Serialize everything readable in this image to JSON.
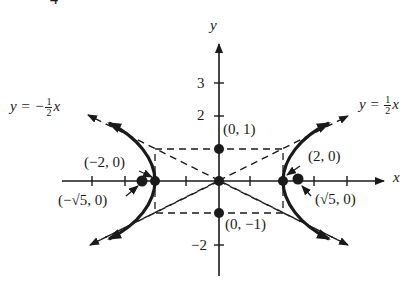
{
  "figure": {
    "number_label": "4",
    "axes": {
      "x_label": "x",
      "y_label": "y",
      "y_ticks": [
        "3",
        "2",
        "−2"
      ]
    },
    "asymptotes": {
      "left": {
        "prefix": "y = −",
        "num": "1",
        "den": "2",
        "var": "x"
      },
      "right": {
        "prefix": "y = ",
        "num": "1",
        "den": "2",
        "var": "x"
      }
    },
    "points": {
      "co_vertex_top": "(0, 1)",
      "co_vertex_bottom": "(0, −1)",
      "vertex_left": "(−2, 0)",
      "vertex_right": "(2, 0)",
      "focus_left": "(−√5, 0)",
      "focus_right": "(√5, 0)"
    },
    "colors": {
      "ink": "#1a1a1a",
      "background": "#ffffff"
    }
  }
}
